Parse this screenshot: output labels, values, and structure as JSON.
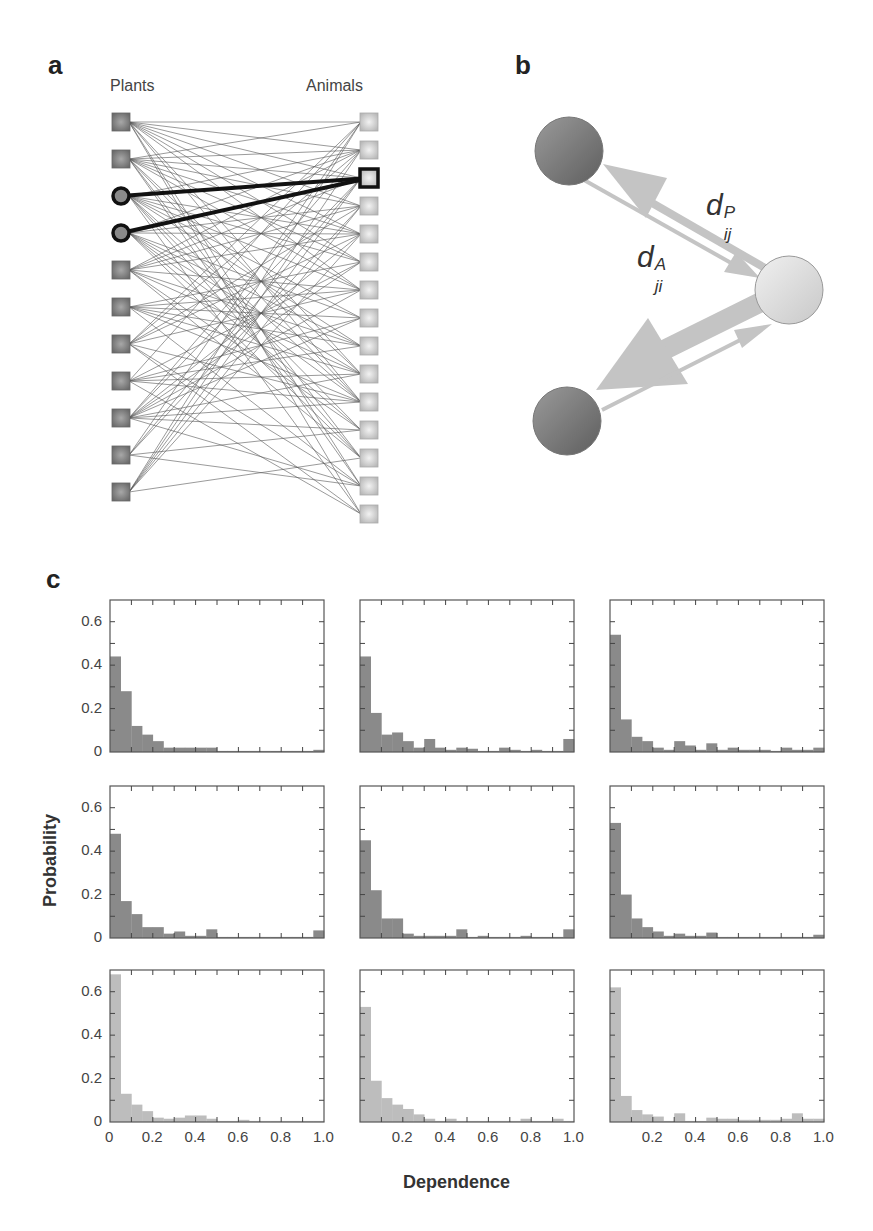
{
  "panels": {
    "a": {
      "letter": "a",
      "left_label": "Plants",
      "right_label": "Animals",
      "plants_count": 11,
      "animals_count": 15,
      "highlighted_plants": [
        2,
        3
      ],
      "highlighted_animal": 2
    },
    "b": {
      "letter": "b",
      "label_dP": {
        "base": "d",
        "sup": "P",
        "sub": "ij"
      },
      "label_dA": {
        "base": "d",
        "sup": "A",
        "sub": "ji"
      }
    },
    "c": {
      "letter": "c",
      "ylabel": "Probability",
      "xlabel": "Dependence"
    }
  },
  "colors": {
    "plant_node": "#6e6e6e",
    "animal_node": "#cfcfcf",
    "dark_bar": "#8a8a8a",
    "light_bar": "#bdbdbd",
    "arrow": "#c4c4c4",
    "axis": "#555555"
  },
  "chart_data": [
    {
      "type": "bar",
      "title": "row1-col1",
      "xlabel": "",
      "ylabel": "Probability",
      "ylim": [
        0,
        0.7
      ],
      "xlim": [
        0,
        1.0
      ],
      "bin_width": 0.05,
      "yticks": [
        "0",
        "0.2",
        "0.4",
        "0.6"
      ],
      "xticks": [],
      "values": [
        0.44,
        0.28,
        0.12,
        0.08,
        0.05,
        0.02,
        0.02,
        0.02,
        0.02,
        0.02,
        0.005,
        0.005,
        0.005,
        0.005,
        0.005,
        0.005,
        0.005,
        0.005,
        0.005,
        0.01
      ]
    },
    {
      "type": "bar",
      "title": "row1-col2",
      "ylim": [
        0,
        0.7
      ],
      "xlim": [
        0,
        1.0
      ],
      "bin_width": 0.05,
      "yticks": [],
      "xticks": [],
      "values": [
        0.44,
        0.18,
        0.08,
        0.09,
        0.05,
        0.02,
        0.06,
        0.02,
        0.01,
        0.02,
        0.015,
        0.005,
        0.005,
        0.02,
        0.01,
        0.005,
        0.01,
        0.005,
        0.005,
        0.06
      ]
    },
    {
      "type": "bar",
      "title": "row1-col3",
      "ylim": [
        0,
        0.7
      ],
      "xlim": [
        0,
        1.0
      ],
      "bin_width": 0.05,
      "yticks": [],
      "xticks": [],
      "values": [
        0.54,
        0.15,
        0.07,
        0.05,
        0.02,
        0.01,
        0.05,
        0.03,
        0.01,
        0.04,
        0.01,
        0.02,
        0.01,
        0.01,
        0.01,
        0.005,
        0.02,
        0.01,
        0.01,
        0.02
      ]
    },
    {
      "type": "bar",
      "title": "row2-col1",
      "ylabel": "Probability",
      "ylim": [
        0,
        0.7
      ],
      "xlim": [
        0,
        1.0
      ],
      "bin_width": 0.05,
      "yticks": [
        "0",
        "0.2",
        "0.4",
        "0.6"
      ],
      "xticks": [],
      "values": [
        0.48,
        0.17,
        0.11,
        0.05,
        0.05,
        0.02,
        0.03,
        0.01,
        0.01,
        0.04,
        0.005,
        0.005,
        0.005,
        0.005,
        0.005,
        0.005,
        0.005,
        0.005,
        0.005,
        0.035
      ]
    },
    {
      "type": "bar",
      "title": "row2-col2",
      "ylim": [
        0,
        0.7
      ],
      "xlim": [
        0,
        1.0
      ],
      "bin_width": 0.05,
      "yticks": [],
      "xticks": [],
      "values": [
        0.45,
        0.22,
        0.09,
        0.09,
        0.02,
        0.01,
        0.01,
        0.01,
        0.01,
        0.04,
        0.005,
        0.01,
        0.005,
        0.005,
        0.005,
        0.01,
        0.005,
        0.005,
        0.005,
        0.04
      ]
    },
    {
      "type": "bar",
      "title": "row2-col3",
      "ylim": [
        0,
        0.7
      ],
      "xlim": [
        0,
        1.0
      ],
      "bin_width": 0.05,
      "yticks": [],
      "xticks": [],
      "values": [
        0.53,
        0.2,
        0.09,
        0.05,
        0.03,
        0.01,
        0.02,
        0.01,
        0.01,
        0.025,
        0.005,
        0.005,
        0.005,
        0.005,
        0.005,
        0.005,
        0.005,
        0.005,
        0.005,
        0.015
      ]
    },
    {
      "type": "bar",
      "title": "row3-col1",
      "xlabel": "Dependence",
      "ylabel": "Probability",
      "ylim": [
        0,
        0.7
      ],
      "xlim": [
        0,
        1.0
      ],
      "bin_width": 0.05,
      "yticks": [
        "0",
        "0.2",
        "0.4",
        "0.6"
      ],
      "xticks": [
        "0",
        "0.2",
        "0.4",
        "0.6",
        "0.8",
        "1.0"
      ],
      "values": [
        0.68,
        0.13,
        0.08,
        0.05,
        0.02,
        0.015,
        0.02,
        0.03,
        0.03,
        0.015,
        0.005,
        0.005,
        0.01,
        0.005,
        0.005,
        0.005,
        0.005,
        0.005,
        0.005,
        0.005
      ]
    },
    {
      "type": "bar",
      "title": "row3-col2",
      "xlabel": "Dependence",
      "ylim": [
        0,
        0.7
      ],
      "xlim": [
        0,
        1.0
      ],
      "bin_width": 0.05,
      "yticks": [],
      "xticks": [
        "0.2",
        "0.4",
        "0.6",
        "0.8",
        "1.0"
      ],
      "values": [
        0.53,
        0.19,
        0.11,
        0.08,
        0.06,
        0.035,
        0.015,
        0.005,
        0.015,
        0.005,
        0.005,
        0.005,
        0.005,
        0.005,
        0.005,
        0.015,
        0.005,
        0.005,
        0.015,
        0.005
      ]
    },
    {
      "type": "bar",
      "title": "row3-col3",
      "xlabel": "Dependence",
      "ylim": [
        0,
        0.7
      ],
      "xlim": [
        0,
        1.0
      ],
      "bin_width": 0.05,
      "yticks": [],
      "xticks": [
        "0.2",
        "0.4",
        "0.6",
        "0.8",
        "1.0"
      ],
      "values": [
        0.62,
        0.12,
        0.055,
        0.035,
        0.025,
        0.005,
        0.04,
        0.005,
        0.005,
        0.02,
        0.015,
        0.015,
        0.01,
        0.01,
        0.01,
        0.01,
        0.015,
        0.04,
        0.015,
        0.015
      ]
    }
  ]
}
